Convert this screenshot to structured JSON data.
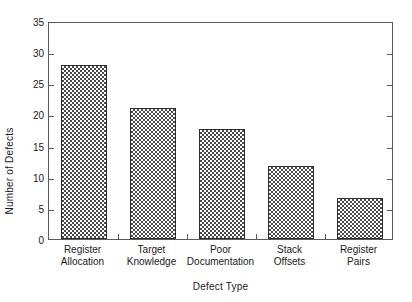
{
  "chart_data": {
    "type": "bar",
    "title": "",
    "subtitle": "",
    "xlabel": "Defect Type",
    "ylabel": "Number of Defects",
    "categories": [
      "Register Allocation",
      "Target Knowledge",
      "Poor Documentation",
      "Stack Offsets",
      "Register Pairs"
    ],
    "category_lines": [
      [
        "Register",
        "Allocation"
      ],
      [
        "Target",
        "Knowledge"
      ],
      [
        "Poor",
        "Documentation"
      ],
      [
        "Stack",
        "Offsets"
      ],
      [
        "Register",
        "Pairs"
      ]
    ],
    "values": [
      28,
      21,
      17.7,
      11.7,
      6.6
    ],
    "ylim": [
      0,
      35
    ],
    "ytick_values": [
      0,
      5,
      10,
      15,
      20,
      25,
      30,
      35
    ],
    "ytick_labels": [
      "0",
      "5",
      "10",
      "15",
      "20",
      "25",
      "30",
      "35"
    ],
    "grid": false,
    "legend": null,
    "legend_position": "none",
    "bar_fill": "checkerboard-hatch",
    "bar_edge_color": "#2e2e2e",
    "bar_pattern_color": "#4a4a4a",
    "frame_color": "#5a5a5a",
    "background_color": "#ffffff"
  }
}
